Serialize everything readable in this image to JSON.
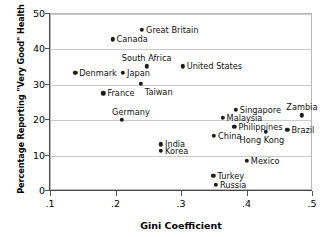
{
  "chart_data": {
    "type": "scatter",
    "title": "",
    "xlabel": "Gini Coefficient",
    "ylabel": "Percentage Reporting \"Very Good\" Health",
    "xlim": [
      0.1,
      0.5
    ],
    "ylim": [
      0,
      50
    ],
    "xticks": [
      ".1",
      ".2",
      ".3",
      ".4",
      ".5"
    ],
    "xtick_values": [
      0.1,
      0.2,
      0.3,
      0.4,
      0.5
    ],
    "yticks": [
      "0",
      "10",
      "20",
      "30",
      "40",
      "50"
    ],
    "ytick_values": [
      0,
      10,
      20,
      30,
      40,
      50
    ],
    "grid": "horizontal",
    "legend": "none",
    "points": [
      {
        "label": "Great Britain",
        "x": 0.239,
        "y": 45.5,
        "lp": "right"
      },
      {
        "label": "Canada",
        "x": 0.194,
        "y": 42.8,
        "lp": "right"
      },
      {
        "label": "South Africa",
        "x": 0.246,
        "y": 35.2,
        "lp": "above"
      },
      {
        "label": "United States",
        "x": 0.301,
        "y": 35.2,
        "lp": "right"
      },
      {
        "label": "Denmark",
        "x": 0.137,
        "y": 33.4,
        "lp": "right"
      },
      {
        "label": "Japan",
        "x": 0.21,
        "y": 33.4,
        "lp": "right"
      },
      {
        "label": "Taiwan",
        "x": 0.237,
        "y": 30.3,
        "lp": "belowright"
      },
      {
        "label": "France",
        "x": 0.18,
        "y": 27.6,
        "lp": "right"
      },
      {
        "label": "Germany",
        "x": 0.208,
        "y": 20.1,
        "lp": "aboveleft"
      },
      {
        "label": "Singapore",
        "x": 0.382,
        "y": 22.9,
        "lp": "right"
      },
      {
        "label": "Zambia",
        "x": 0.483,
        "y": 21.4,
        "lp": "above"
      },
      {
        "label": "Malaysia",
        "x": 0.362,
        "y": 20.6,
        "lp": "right"
      },
      {
        "label": "Philippines",
        "x": 0.38,
        "y": 18.2,
        "lp": "right"
      },
      {
        "label": "Brazil",
        "x": 0.461,
        "y": 17.3,
        "lp": "right"
      },
      {
        "label": "Hong Kong",
        "x": 0.428,
        "y": 16.8,
        "lp": "belowleft"
      },
      {
        "label": "China",
        "x": 0.349,
        "y": 15.6,
        "lp": "right"
      },
      {
        "label": "India",
        "x": 0.268,
        "y": 13.2,
        "lp": "right"
      },
      {
        "label": "Korea",
        "x": 0.268,
        "y": 11.4,
        "lp": "right"
      },
      {
        "label": "Mexico",
        "x": 0.399,
        "y": 8.6,
        "lp": "right"
      },
      {
        "label": "Turkey",
        "x": 0.348,
        "y": 4.3,
        "lp": "right"
      },
      {
        "label": "Russia",
        "x": 0.352,
        "y": 1.7,
        "lp": "right"
      }
    ]
  }
}
